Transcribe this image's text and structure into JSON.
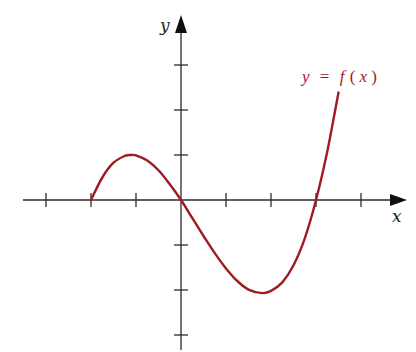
{
  "chart_data": {
    "type": "line",
    "title": "",
    "xlabel": "x",
    "ylabel": "y",
    "series": [
      {
        "name": "y = f(x)",
        "color": "#9e1b22",
        "x": [
          -2.0,
          -1.75,
          -1.5,
          -1.25,
          -1.1,
          -1.0,
          -0.75,
          -0.5,
          -0.25,
          0.0,
          0.25,
          0.5,
          0.75,
          1.0,
          1.25,
          1.5,
          1.8,
          2.0,
          2.25,
          2.5,
          2.75,
          3.0,
          3.25,
          3.5
        ],
        "y": [
          0.0,
          0.5,
          0.83,
          0.98,
          1.0,
          0.99,
          0.88,
          0.66,
          0.35,
          0.0,
          -0.4,
          -0.8,
          -1.18,
          -1.52,
          -1.8,
          -1.99,
          -2.07,
          -2.02,
          -1.83,
          -1.45,
          -0.85,
          0.0,
          1.08,
          2.39
        ]
      }
    ],
    "annotations": [
      {
        "text": "y = f(x)",
        "position": [
          2.7,
          2.6
        ],
        "color": "#9e1b22"
      }
    ],
    "x_ticks": [
      -3,
      -2,
      -1,
      1,
      2,
      3,
      4
    ],
    "y_ticks": [
      -3,
      -2,
      -1,
      1,
      2,
      3
    ],
    "tick_labels_shown": false,
    "xlim": [
      -3.5,
      5.0
    ],
    "ylim": [
      -3.3,
      4.1
    ],
    "grid": false,
    "legend": "none",
    "notes": {
      "start_point": [
        -2,
        0
      ],
      "local_max": [
        -1.1,
        1.0
      ],
      "through_origin": [
        0,
        0
      ],
      "local_min": [
        1.8,
        -2.07
      ],
      "x_intercepts": [
        -2,
        0,
        3
      ],
      "end_point": [
        3.5,
        2.39
      ]
    }
  },
  "labels": {
    "x_axis": "x",
    "y_axis": "y",
    "function": {
      "lhs": "y",
      "eq": "=",
      "f": "f",
      "open": "(",
      "arg": "x",
      "close": ")"
    }
  },
  "colors": {
    "curve": "#9e1b22",
    "axes": "#2a2a2a",
    "background": "#ffffff"
  }
}
